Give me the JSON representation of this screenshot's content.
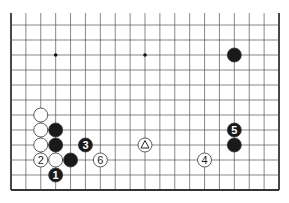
{
  "diagram": {
    "type": "go-board-fragment",
    "columns": 19,
    "rows_visible": 12,
    "open_top": true,
    "colors": {
      "line": "#555555",
      "edge": "#333333",
      "black": "#1a1a1a",
      "white": "#ffffff"
    },
    "star_points": [
      [
        3,
        2
      ],
      [
        9,
        2
      ],
      [
        15,
        2
      ]
    ],
    "stones": [
      {
        "color": "black",
        "col": 15,
        "row": 2,
        "label": ""
      },
      {
        "color": "white",
        "col": 2,
        "row": 6,
        "label": ""
      },
      {
        "color": "white",
        "col": 2,
        "row": 7,
        "label": ""
      },
      {
        "color": "black",
        "col": 3,
        "row": 7,
        "label": ""
      },
      {
        "color": "white",
        "col": 2,
        "row": 8,
        "label": ""
      },
      {
        "color": "black",
        "col": 3,
        "row": 8,
        "label": ""
      },
      {
        "color": "black",
        "col": 5,
        "row": 8,
        "label": "3"
      },
      {
        "color": "white",
        "col": 9,
        "row": 8,
        "label": "",
        "mark": "triangle"
      },
      {
        "color": "black",
        "col": 15,
        "row": 8,
        "label": ""
      },
      {
        "color": "white",
        "col": 2,
        "row": 9,
        "label": "2"
      },
      {
        "color": "white",
        "col": 3,
        "row": 9,
        "label": ""
      },
      {
        "color": "black",
        "col": 4,
        "row": 9,
        "label": ""
      },
      {
        "color": "white",
        "col": 6,
        "row": 9,
        "label": "6"
      },
      {
        "color": "white",
        "col": 13,
        "row": 9,
        "label": "4"
      },
      {
        "color": "black",
        "col": 3,
        "row": 10,
        "label": "1"
      },
      {
        "color": "black",
        "col": 15,
        "row": 7,
        "label": "5"
      }
    ]
  }
}
